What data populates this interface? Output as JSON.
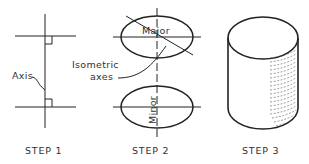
{
  "diagram": {
    "type": "technical-drawing-steps",
    "line_color": "#222222",
    "steps": [
      {
        "label": "STEP 1",
        "annotations": {
          "axis_label": "Axis"
        }
      },
      {
        "label": "STEP 2",
        "annotations": {
          "major_label": "Major",
          "minor_label": "Minor",
          "isometric_label_line1": "Isometric",
          "isometric_label_line2": "axes"
        }
      },
      {
        "label": "STEP 3",
        "annotations": {}
      }
    ]
  }
}
